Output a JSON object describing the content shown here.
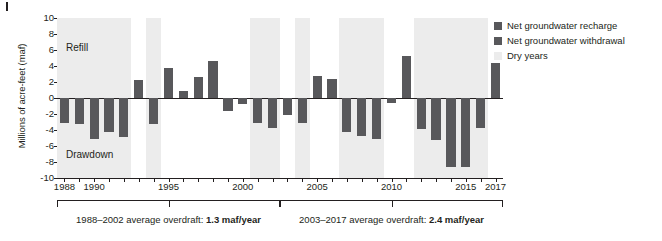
{
  "chart_data": {
    "type": "bar",
    "title": "",
    "subtitle": "",
    "xlabel": "",
    "ylabel": "Millions of acre-feet (maf)",
    "ylim": [
      -10,
      10
    ],
    "xlim": [
      1987.5,
      2017.5
    ],
    "grid": false,
    "y_ticks": [
      10,
      8,
      6,
      4,
      2,
      0,
      -2,
      -4,
      -6,
      -8,
      -10
    ],
    "y_tick_labels": [
      "10",
      "8",
      "6",
      "4",
      "2",
      "0",
      "-2",
      "-4",
      "-6",
      "-8",
      "-10"
    ],
    "x_tick_labels": [
      "1988",
      "1990",
      "1995",
      "2000",
      "2005",
      "2010",
      "2015",
      "2017"
    ],
    "x_tick_values": [
      1988,
      1990,
      1995,
      2000,
      2005,
      2010,
      2015,
      2017
    ],
    "categories": [
      1988,
      1989,
      1990,
      1991,
      1992,
      1993,
      1994,
      1995,
      1996,
      1997,
      1998,
      1999,
      2000,
      2001,
      2002,
      2003,
      2004,
      2005,
      2006,
      2007,
      2008,
      2009,
      2010,
      2011,
      2012,
      2013,
      2014,
      2015,
      2016,
      2017
    ],
    "values": [
      -3.1,
      -3.2,
      -5.1,
      -4.3,
      -4.9,
      2.3,
      -3.2,
      3.7,
      0.9,
      2.6,
      4.6,
      -1.6,
      -0.7,
      -3.1,
      -3.8,
      -2.1,
      -3.1,
      2.7,
      2.4,
      -4.3,
      -4.8,
      -5.1,
      -0.6,
      5.2,
      -3.9,
      -5.2,
      -8.6,
      -8.6,
      -3.7,
      4.4
    ],
    "positive_label": "Net groundwater recharge",
    "negative_label": "Net groundwater withdrawal",
    "band_label": "Dry years",
    "dry_year_bands": [
      {
        "start": 1987.5,
        "end": 1992.5
      },
      {
        "start": 1993.5,
        "end": 1994.5
      },
      {
        "start": 2000.5,
        "end": 2002.5
      },
      {
        "start": 2003.5,
        "end": 2004.5
      },
      {
        "start": 2006.5,
        "end": 2009.5
      },
      {
        "start": 2011.5,
        "end": 2016.5
      }
    ],
    "annotations": [
      {
        "name": "refill",
        "text": "Refill"
      },
      {
        "name": "drawdown",
        "text": "Drawdown"
      }
    ],
    "colors": {
      "bar": "#58585b",
      "dry_band": "#ececec",
      "axis": "#231f20",
      "background": "#ffffff"
    }
  },
  "legend": {
    "position": "right",
    "items": [
      {
        "label": "Net groundwater recharge",
        "color": "#58585b",
        "swatch": "square"
      },
      {
        "label": "Net groundwater withdrawal",
        "color": "#58585b",
        "swatch": "square"
      },
      {
        "label": "Dry years",
        "color": "#ececec",
        "swatch": "square"
      }
    ]
  },
  "brackets": [
    {
      "name": "bracket-1988-2002",
      "start_year": 1988,
      "end_year": 2002,
      "caption_prefix": "1988–2002 average overdraft: ",
      "caption_value": "1.3 maf/year"
    },
    {
      "name": "bracket-2003-2017",
      "start_year": 2003,
      "end_year": 2017,
      "caption_prefix": "2003–2017 average overdraft: ",
      "caption_value": "2.4 maf/year"
    }
  ]
}
